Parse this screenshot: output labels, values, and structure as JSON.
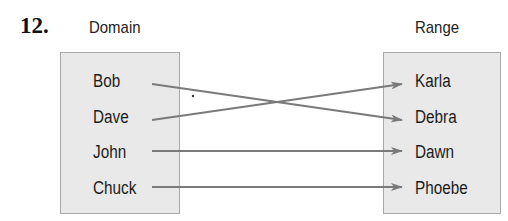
{
  "problem_number": "12.",
  "domain": {
    "title": "Domain",
    "items": [
      "Bob",
      "Dave",
      "John",
      "Chuck"
    ]
  },
  "range": {
    "title": "Range",
    "items": [
      "Karla",
      "Debra",
      "Dawn",
      "Phoebe"
    ]
  },
  "mappings": [
    {
      "from": "Bob",
      "to": "Debra"
    },
    {
      "from": "Dave",
      "to": "Karla"
    },
    {
      "from": "John",
      "to": "Dawn"
    },
    {
      "from": "Chuck",
      "to": "Phoebe"
    }
  ],
  "colors": {
    "box_fill": "#e9e9e9",
    "box_border": "#a8a8a8",
    "arrow": "#7a7a7a"
  }
}
